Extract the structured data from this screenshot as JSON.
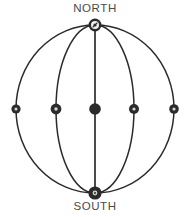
{
  "diagram": {
    "title_north": "NORTH",
    "title_south": "SOUTH",
    "type": "sphere-meridian-diagram",
    "stroke_color": "#2b2b2b",
    "node_fill_color": "#2b2b2b",
    "node_inner_color": "#d8d8d8",
    "label_color": "#4a4a4a",
    "background_color": "#ffffff",
    "geometry": {
      "center_x": 95,
      "center_y": 109,
      "outer_radius_x": 79,
      "outer_radius_y": 84,
      "north_pole": {
        "x": 95,
        "y": 25
      },
      "south_pole": {
        "x": 95,
        "y": 193
      },
      "meridian_half_widths": [
        79,
        39,
        0
      ],
      "equator_y": 109
    },
    "nodes": [
      {
        "name": "node-far-left",
        "x": 16,
        "y": 109,
        "r": 4.6,
        "style": "ringed"
      },
      {
        "name": "node-left",
        "x": 56,
        "y": 109,
        "r": 5.4,
        "style": "ringed"
      },
      {
        "name": "node-center",
        "x": 95,
        "y": 109,
        "r": 5.8,
        "style": "solid"
      },
      {
        "name": "node-right",
        "x": 134,
        "y": 109,
        "r": 5.0,
        "style": "ringed"
      },
      {
        "name": "node-far-right",
        "x": 174,
        "y": 109,
        "r": 4.8,
        "style": "ringed"
      },
      {
        "name": "node-north-pole",
        "x": 95,
        "y": 25,
        "r": 6.4,
        "style": "ringed"
      },
      {
        "name": "node-south-pole",
        "x": 95,
        "y": 193,
        "r": 6.6,
        "style": "solid-ringed"
      }
    ]
  }
}
